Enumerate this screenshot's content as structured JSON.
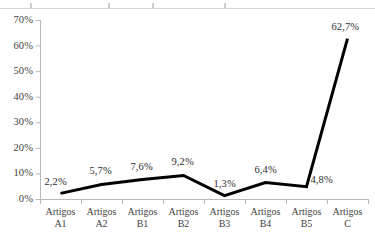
{
  "chart_data": {
    "type": "line",
    "title": "",
    "subtitle": "",
    "xlabel": "",
    "ylabel": "",
    "categories": [
      "Artigos A1",
      "Artigos A2",
      "Artigos B1",
      "Artigos B2",
      "Artigos B3",
      "Artigos B4",
      "Artigos B5",
      "Artigos C"
    ],
    "category_lines": [
      [
        "Artigos",
        "A1"
      ],
      [
        "Artigos",
        "A2"
      ],
      [
        "Artigos",
        "B1"
      ],
      [
        "Artigos",
        "B2"
      ],
      [
        "Artigos",
        "B3"
      ],
      [
        "Artigos",
        "B4"
      ],
      [
        "Artigos",
        "B5"
      ],
      [
        "Artigos",
        "C"
      ]
    ],
    "values": [
      2.2,
      5.7,
      7.6,
      9.2,
      1.3,
      6.4,
      4.8,
      62.7
    ],
    "data_labels": [
      "2,2%",
      "5,7%",
      "7,6%",
      "9,2%",
      "1,3%",
      "6,4%",
      "4,8%",
      "62,7%"
    ],
    "ylim": [
      0,
      70
    ],
    "ytick_values": [
      0,
      10,
      20,
      30,
      40,
      50,
      60,
      70
    ],
    "ytick_labels": [
      "0%",
      "10%",
      "20%",
      "30%",
      "40%",
      "50%",
      "60%",
      "70%"
    ],
    "grid": false,
    "legend": false,
    "legend_position": "none",
    "series": [
      {
        "name": "",
        "values": [
          2.2,
          5.7,
          7.6,
          9.2,
          1.3,
          6.4,
          4.8,
          62.7
        ],
        "color": "#000000",
        "line_width": 3,
        "markers": false
      }
    ],
    "axis_color": "#b8b8b8",
    "background_color": "#ffffff",
    "decimal_separator": ",",
    "unit": "%"
  },
  "layout": {
    "plot_left": 40,
    "plot_right": 368,
    "plot_top": 20,
    "plot_bottom": 199
  }
}
